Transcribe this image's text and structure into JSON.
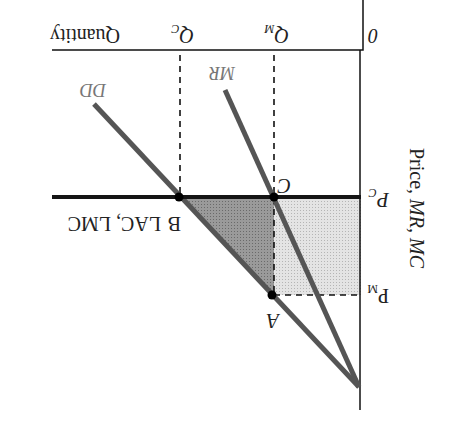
{
  "diagram": {
    "orientation": "rotated-180",
    "axes": {
      "origin_label": "0",
      "x_label": "Quantity",
      "y_label_prefix": "Price, ",
      "y_label_italic": "MR, MC"
    },
    "curves": {
      "demand": "DD",
      "marginal_revenue": "MR",
      "cost": "LAC, LMC"
    },
    "points": {
      "a": "A",
      "b": "B",
      "c": "C"
    },
    "ticks": {
      "q_m": "Q",
      "q_m_sub": "M",
      "q_c": "Q",
      "q_c_sub": "C",
      "p_m": "P",
      "p_m_sub": "M",
      "p_c": "P",
      "p_c_sub": "C"
    },
    "regions": {
      "monopoly_profit_rectangle": "light-shaded",
      "deadweight_loss_triangle": "dark-shaded"
    },
    "colors": {
      "axis": "#111111",
      "curve": "#555555",
      "cost_line": "#151515",
      "light_fill": "#d9d9d9",
      "dark_fill": "#8e8e8e",
      "label_gray": "#777777"
    }
  }
}
